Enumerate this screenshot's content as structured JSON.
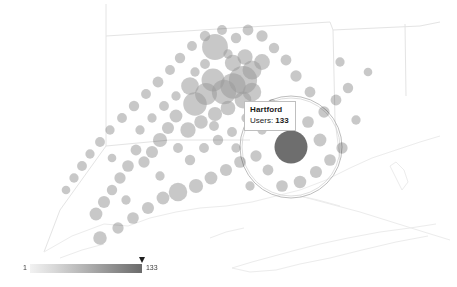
{
  "map": {
    "name": "connecticut-user-bubble-map",
    "background_color": "#ffffff",
    "boundary_color": "#e2e2e2",
    "coast_color": "#e8e8e8",
    "bubble_color": "#9a9a9a",
    "bubble_opacity": 0.55,
    "selected_bubble_color": "#6e6e6e",
    "selection_ring_color": "#b0b0b0"
  },
  "tooltip": {
    "name": "map-tooltip",
    "title": "Hartford",
    "metric_label": "Users:",
    "metric_value": "133",
    "background": "#ffffff",
    "border_color": "#bfbfbf"
  },
  "legend": {
    "name": "bubble-size-legend",
    "min_label": "1",
    "max_label": "133",
    "marker_value": "133",
    "gradient_start": "#f2f2f2",
    "gradient_end": "#6b6b6b"
  },
  "chart_data": {
    "type": "scatter",
    "title": "",
    "xlabel": "",
    "ylabel": "",
    "value_field": "Users",
    "value_range": [
      1,
      133
    ],
    "selected_point": {
      "label": "Hartford",
      "value": 133,
      "x": 291,
      "y": 147
    },
    "points": [
      {
        "x": 291,
        "y": 147,
        "value": 133,
        "label": "Hartford",
        "selected": true
      },
      {
        "x": 215,
        "y": 47,
        "value": 78
      },
      {
        "x": 243,
        "y": 80,
        "value": 96
      },
      {
        "x": 233,
        "y": 86,
        "value": 74
      },
      {
        "x": 224,
        "y": 92,
        "value": 68
      },
      {
        "x": 213,
        "y": 80,
        "value": 58
      },
      {
        "x": 206,
        "y": 94,
        "value": 52
      },
      {
        "x": 195,
        "y": 104,
        "value": 62
      },
      {
        "x": 190,
        "y": 86,
        "value": 30
      },
      {
        "x": 252,
        "y": 70,
        "value": 36
      },
      {
        "x": 262,
        "y": 62,
        "value": 22
      },
      {
        "x": 245,
        "y": 57,
        "value": 20
      },
      {
        "x": 233,
        "y": 63,
        "value": 24
      },
      {
        "x": 252,
        "y": 92,
        "value": 34
      },
      {
        "x": 243,
        "y": 100,
        "value": 26
      },
      {
        "x": 228,
        "y": 108,
        "value": 18
      },
      {
        "x": 215,
        "y": 114,
        "value": 16
      },
      {
        "x": 201,
        "y": 122,
        "value": 14
      },
      {
        "x": 188,
        "y": 130,
        "value": 20
      },
      {
        "x": 176,
        "y": 116,
        "value": 12
      },
      {
        "x": 168,
        "y": 128,
        "value": 10
      },
      {
        "x": 160,
        "y": 140,
        "value": 16
      },
      {
        "x": 152,
        "y": 152,
        "value": 10
      },
      {
        "x": 144,
        "y": 162,
        "value": 8
      },
      {
        "x": 136,
        "y": 150,
        "value": 7
      },
      {
        "x": 128,
        "y": 166,
        "value": 9
      },
      {
        "x": 120,
        "y": 178,
        "value": 8
      },
      {
        "x": 112,
        "y": 190,
        "value": 6
      },
      {
        "x": 104,
        "y": 202,
        "value": 10
      },
      {
        "x": 96,
        "y": 214,
        "value": 12
      },
      {
        "x": 100,
        "y": 238,
        "value": 14
      },
      {
        "x": 118,
        "y": 228,
        "value": 8
      },
      {
        "x": 133,
        "y": 218,
        "value": 9
      },
      {
        "x": 148,
        "y": 208,
        "value": 10
      },
      {
        "x": 163,
        "y": 198,
        "value": 12
      },
      {
        "x": 178,
        "y": 192,
        "value": 34
      },
      {
        "x": 196,
        "y": 186,
        "value": 16
      },
      {
        "x": 211,
        "y": 178,
        "value": 12
      },
      {
        "x": 226,
        "y": 170,
        "value": 10
      },
      {
        "x": 240,
        "y": 162,
        "value": 9
      },
      {
        "x": 256,
        "y": 156,
        "value": 8
      },
      {
        "x": 268,
        "y": 170,
        "value": 7
      },
      {
        "x": 282,
        "y": 186,
        "value": 9
      },
      {
        "x": 300,
        "y": 182,
        "value": 11
      },
      {
        "x": 316,
        "y": 172,
        "value": 10
      },
      {
        "x": 330,
        "y": 160,
        "value": 9
      },
      {
        "x": 342,
        "y": 148,
        "value": 8
      },
      {
        "x": 320,
        "y": 140,
        "value": 12
      },
      {
        "x": 308,
        "y": 122,
        "value": 9
      },
      {
        "x": 324,
        "y": 112,
        "value": 8
      },
      {
        "x": 336,
        "y": 100,
        "value": 7
      },
      {
        "x": 348,
        "y": 88,
        "value": 6
      },
      {
        "x": 310,
        "y": 92,
        "value": 7
      },
      {
        "x": 296,
        "y": 76,
        "value": 8
      },
      {
        "x": 286,
        "y": 60,
        "value": 7
      },
      {
        "x": 274,
        "y": 48,
        "value": 6
      },
      {
        "x": 262,
        "y": 36,
        "value": 8
      },
      {
        "x": 248,
        "y": 30,
        "value": 7
      },
      {
        "x": 236,
        "y": 38,
        "value": 6
      },
      {
        "x": 222,
        "y": 30,
        "value": 5
      },
      {
        "x": 205,
        "y": 36,
        "value": 6
      },
      {
        "x": 192,
        "y": 46,
        "value": 5
      },
      {
        "x": 180,
        "y": 58,
        "value": 6
      },
      {
        "x": 170,
        "y": 70,
        "value": 5
      },
      {
        "x": 158,
        "y": 82,
        "value": 7
      },
      {
        "x": 146,
        "y": 94,
        "value": 5
      },
      {
        "x": 134,
        "y": 106,
        "value": 6
      },
      {
        "x": 122,
        "y": 118,
        "value": 5
      },
      {
        "x": 110,
        "y": 130,
        "value": 4
      },
      {
        "x": 100,
        "y": 142,
        "value": 5
      },
      {
        "x": 90,
        "y": 154,
        "value": 4
      },
      {
        "x": 82,
        "y": 166,
        "value": 5
      },
      {
        "x": 74,
        "y": 178,
        "value": 4
      },
      {
        "x": 66,
        "y": 190,
        "value": 3
      },
      {
        "x": 140,
        "y": 130,
        "value": 4
      },
      {
        "x": 152,
        "y": 118,
        "value": 4
      },
      {
        "x": 164,
        "y": 106,
        "value": 5
      },
      {
        "x": 178,
        "y": 148,
        "value": 5
      },
      {
        "x": 190,
        "y": 160,
        "value": 6
      },
      {
        "x": 204,
        "y": 148,
        "value": 5
      },
      {
        "x": 218,
        "y": 140,
        "value": 6
      },
      {
        "x": 232,
        "y": 132,
        "value": 5
      },
      {
        "x": 205,
        "y": 64,
        "value": 5
      },
      {
        "x": 228,
        "y": 54,
        "value": 4
      },
      {
        "x": 195,
        "y": 72,
        "value": 4
      },
      {
        "x": 176,
        "y": 96,
        "value": 4
      },
      {
        "x": 214,
        "y": 126,
        "value": 5
      },
      {
        "x": 246,
        "y": 118,
        "value": 4
      },
      {
        "x": 272,
        "y": 104,
        "value": 4
      },
      {
        "x": 286,
        "y": 118,
        "value": 5
      },
      {
        "x": 262,
        "y": 130,
        "value": 4
      },
      {
        "x": 236,
        "y": 148,
        "value": 4
      },
      {
        "x": 250,
        "y": 186,
        "value": 4
      },
      {
        "x": 160,
        "y": 176,
        "value": 4
      },
      {
        "x": 126,
        "y": 200,
        "value": 4
      },
      {
        "x": 112,
        "y": 158,
        "value": 3
      },
      {
        "x": 340,
        "y": 62,
        "value": 4
      },
      {
        "x": 356,
        "y": 120,
        "value": 4
      },
      {
        "x": 368,
        "y": 72,
        "value": 3
      }
    ]
  }
}
